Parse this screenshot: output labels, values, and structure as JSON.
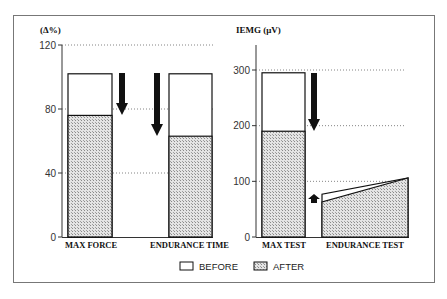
{
  "chart_data": [
    {
      "type": "bar",
      "title": "",
      "ylabel": "(Δ%)",
      "xlabel": "",
      "ylim": [
        0,
        120
      ],
      "yticks": [
        0,
        40,
        80,
        120
      ],
      "ytick_labels": [
        "0",
        "40",
        "80",
        "120"
      ],
      "grid": "dotted horizontal",
      "categories": [
        "MAX FORCE",
        "ENDURANCE TIME"
      ],
      "series": [
        {
          "name": "BEFORE",
          "values": [
            102,
            102
          ]
        },
        {
          "name": "AFTER",
          "values": [
            76,
            63
          ]
        }
      ],
      "annotations": [
        "down-arrow beside MAX FORCE",
        "down-arrow beside ENDURANCE TIME"
      ]
    },
    {
      "type": "bar",
      "title": "",
      "ylabel": "IEMG (μV)",
      "xlabel": "",
      "ylim": [
        0,
        300
      ],
      "yticks": [
        0,
        100,
        200,
        300
      ],
      "ytick_labels": [
        "0",
        "100",
        "200",
        "300"
      ],
      "grid": "dotted horizontal",
      "categories": [
        "MAX TEST",
        "ENDURANCE TEST"
      ],
      "series": [
        {
          "name": "BEFORE",
          "values": [
            295,
            [
              77,
              106
            ]
          ]
        },
        {
          "name": "AFTER",
          "values": [
            190,
            [
              63,
              106
            ]
          ]
        }
      ],
      "notes": "ENDURANCE TEST shown as area rising from start to end of test",
      "annotations": [
        "down-arrow beside MAX TEST",
        "small up-arrow before ENDURANCE TEST"
      ]
    }
  ],
  "legend": {
    "position": "bottom-center",
    "items": [
      {
        "label": "BEFORE",
        "style": "empty"
      },
      {
        "label": "AFTER",
        "style": "stippled"
      }
    ]
  },
  "colors": {
    "before_fill": "#ffffff",
    "after_fill": "#d8d8d8",
    "stroke": "#111111",
    "grid": "#666666"
  }
}
